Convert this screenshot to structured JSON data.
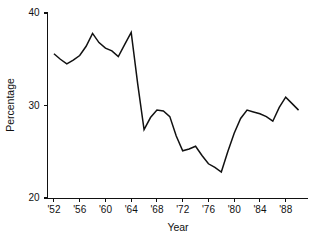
{
  "chart_data": {
    "type": "line",
    "title": "",
    "xlabel": "Year",
    "ylabel": "Percentage",
    "xlim": [
      1951,
      1991
    ],
    "ylim": [
      20,
      40
    ],
    "grid": false,
    "legend": "none",
    "y_ticks": [
      20,
      30,
      40
    ],
    "y_tick_labels": [
      "20",
      "30",
      "40"
    ],
    "x_ticks": [
      1952,
      1956,
      1960,
      1964,
      1968,
      1972,
      1976,
      1980,
      1984,
      1988
    ],
    "x_tick_labels": [
      "'52",
      "'56",
      "'60",
      "'64",
      "'68",
      "'72",
      "'76",
      "'80",
      "'84",
      "'88"
    ],
    "line_color": "#111111",
    "x": [
      1952,
      1953,
      1954,
      1955,
      1956,
      1957,
      1958,
      1959,
      1960,
      1961,
      1962,
      1963,
      1964,
      1965,
      1966,
      1967,
      1968,
      1969,
      1970,
      1971,
      1972,
      1973,
      1974,
      1975,
      1976,
      1977,
      1978,
      1979,
      1980,
      1981,
      1982,
      1983,
      1984,
      1985,
      1986,
      1987,
      1988,
      1989,
      1990
    ],
    "values": [
      35.6,
      35.0,
      34.5,
      34.9,
      35.4,
      36.4,
      37.8,
      36.8,
      36.2,
      35.9,
      35.3,
      36.6,
      37.9,
      32.4,
      27.4,
      28.7,
      29.5,
      29.4,
      28.8,
      26.7,
      25.1,
      25.3,
      25.6,
      24.6,
      23.7,
      23.3,
      22.8,
      25.0,
      27.0,
      28.6,
      29.5,
      29.3,
      29.1,
      28.8,
      28.3,
      29.8,
      30.9,
      30.2,
      29.5
    ],
    "series": [
      {
        "name": "Percentage",
        "values": [
          35.6,
          35.0,
          34.5,
          34.9,
          35.4,
          36.4,
          37.8,
          36.8,
          36.2,
          35.9,
          35.3,
          36.6,
          37.9,
          32.4,
          27.4,
          28.7,
          29.5,
          29.4,
          28.8,
          26.7,
          25.1,
          25.3,
          25.6,
          24.6,
          23.7,
          23.3,
          22.8,
          25.0,
          27.0,
          28.6,
          29.5,
          29.3,
          29.1,
          28.8,
          28.3,
          29.8,
          30.9,
          30.2,
          29.5
        ]
      }
    ]
  }
}
